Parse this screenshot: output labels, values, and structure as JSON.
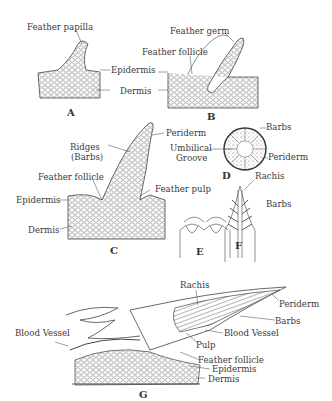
{
  "figure": {
    "panels": [
      {
        "id": "A",
        "label": "A",
        "annotations": [
          "Feather papilla",
          "Epidermis",
          "Dermis"
        ]
      },
      {
        "id": "B",
        "label": "B",
        "annotations": [
          "Feather germ",
          "Feather follicle"
        ]
      },
      {
        "id": "C",
        "label": "C",
        "annotations": [
          "Ridges",
          "(Barbs)",
          "Periderm",
          "Feather follicle",
          "Feather pulp",
          "Epidermis",
          "Dermis"
        ]
      },
      {
        "id": "D",
        "label": "D",
        "annotations": [
          "Barbs",
          "Umbilical",
          "Groove",
          "Periderm"
        ]
      },
      {
        "id": "E",
        "label": "E",
        "annotations": []
      },
      {
        "id": "F",
        "label": "F",
        "annotations": [
          "Rachis",
          "Barbs"
        ]
      },
      {
        "id": "G",
        "label": "G",
        "annotations": [
          "Rachis",
          "Periderm",
          "Barbs",
          "Blood Vessel",
          "Blood Vessel",
          "Pulp",
          "Feather follicle",
          "Epidermis",
          "Dermis"
        ]
      }
    ]
  },
  "labels": {
    "a_papilla": "Feather papilla",
    "a_epidermis": "Epidermis",
    "a_dermis": "Dermis",
    "a_panel": "A",
    "b_germ": "Feather germ",
    "b_follicle": "Feather follicle",
    "b_panel": "B",
    "c_ridges": "Ridges",
    "c_barbs": "(Barbs)",
    "c_periderm": "Periderm",
    "c_follicle": "Feather follicle",
    "c_pulp": "Feather pulp",
    "c_epidermis": "Epidermis",
    "c_dermis": "Dermis",
    "c_panel": "C",
    "d_barbs": "Barbs",
    "d_umbilical": "Umbilical",
    "d_groove": "Groove",
    "d_periderm": "Periderm",
    "d_panel": "D",
    "e_panel": "E",
    "f_rachis": "Rachis",
    "f_barbs": "Barbs",
    "f_panel": "F",
    "g_rachis": "Rachis",
    "g_periderm": "Periderm",
    "g_barbs": "Barbs",
    "g_blood_vessel_right": "Blood Vessel",
    "g_blood_vessel_left": "Blood Vessel",
    "g_pulp": "Pulp",
    "g_follicle": "Feather follicle",
    "g_epidermis": "Epidermis",
    "g_dermis": "Dermis",
    "g_panel": "G"
  }
}
